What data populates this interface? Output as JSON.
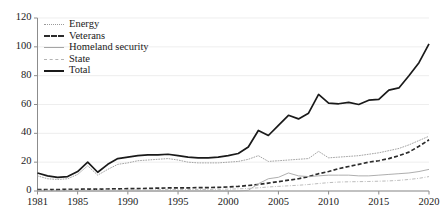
{
  "chart_data": {
    "type": "line",
    "title": "",
    "subtitle": "",
    "xlabel": "",
    "ylabel": "",
    "xlim": [
      1981,
      2020
    ],
    "ylim": [
      0,
      120
    ],
    "yticks": [
      0,
      20,
      40,
      60,
      80,
      100,
      120
    ],
    "xticks": [
      1981,
      1985,
      1990,
      1995,
      2000,
      2005,
      2010,
      2015,
      2020
    ],
    "grid": true,
    "legend_position": "upper-left",
    "x": [
      1981,
      1982,
      1983,
      1984,
      1985,
      1986,
      1987,
      1988,
      1989,
      1990,
      1991,
      1992,
      1993,
      1994,
      1995,
      1996,
      1997,
      1998,
      1999,
      2000,
      2001,
      2002,
      2003,
      2004,
      2005,
      2006,
      2007,
      2008,
      2009,
      2010,
      2011,
      2012,
      2013,
      2014,
      2015,
      2016,
      2017,
      2018,
      2019,
      2020
    ],
    "series": [
      {
        "name": "Energy",
        "style": "dotted",
        "color": "#9a9a9a",
        "values": [
          10.5,
          8.5,
          8.0,
          8.5,
          11.5,
          17.5,
          11.0,
          15.0,
          18.5,
          19.5,
          21.0,
          21.5,
          22.0,
          22.5,
          21.5,
          20.0,
          19.5,
          19.5,
          19.5,
          20.0,
          20.5,
          22.0,
          24.5,
          20.5,
          21.0,
          21.5,
          22.0,
          22.5,
          27.5,
          23.0,
          23.5,
          24.0,
          24.5,
          25.5,
          26.5,
          28.0,
          29.5,
          32.0,
          35.0,
          38.0
        ]
      },
      {
        "name": "Veterans",
        "style": "dashed",
        "color": "#2b2b2b",
        "values": [
          1.0,
          1.0,
          1.0,
          1.2,
          1.2,
          1.3,
          1.3,
          1.4,
          1.5,
          1.6,
          1.7,
          1.8,
          2.0,
          2.1,
          2.2,
          2.2,
          2.3,
          2.4,
          2.5,
          2.8,
          3.2,
          3.8,
          4.5,
          5.5,
          6.5,
          7.5,
          8.5,
          10.0,
          12.0,
          13.5,
          15.5,
          17.0,
          18.5,
          20.0,
          21.0,
          22.5,
          24.5,
          27.0,
          31.0,
          35.5
        ]
      },
      {
        "name": "Homeland security",
        "style": "solid-thin",
        "color": "#a5a5a5",
        "values": [
          0,
          0,
          0,
          0,
          0,
          0,
          0,
          0,
          0,
          0,
          0,
          0,
          0,
          0,
          0,
          0,
          0,
          0,
          0,
          0,
          0,
          0.5,
          5.0,
          8.5,
          9.5,
          12.5,
          10.5,
          10.0,
          10.5,
          11.0,
          11.0,
          11.0,
          10.5,
          10.5,
          11.0,
          11.5,
          12.0,
          12.5,
          13.5,
          15.0
        ]
      },
      {
        "name": "State",
        "style": "dash-dot",
        "color": "#b4b4b4",
        "values": [
          0.5,
          0.5,
          0.5,
          0.5,
          0.5,
          0.6,
          0.6,
          0.6,
          0.7,
          0.7,
          0.8,
          0.8,
          0.9,
          0.9,
          1.0,
          1.0,
          1.1,
          1.1,
          1.2,
          1.3,
          1.5,
          1.8,
          2.2,
          2.8,
          3.2,
          3.6,
          4.0,
          4.5,
          5.2,
          5.8,
          6.2,
          6.4,
          6.5,
          6.6,
          6.8,
          7.0,
          7.4,
          8.0,
          8.8,
          10.0
        ]
      },
      {
        "name": "Total",
        "style": "solid-thick",
        "color": "#1a1a1a",
        "values": [
          12.5,
          10.5,
          9.5,
          10.0,
          13.5,
          20.0,
          13.0,
          18.5,
          22.5,
          23.5,
          24.5,
          25.0,
          25.0,
          25.5,
          24.5,
          23.5,
          23.0,
          23.0,
          23.5,
          24.5,
          26.0,
          30.5,
          42.0,
          38.5,
          45.5,
          52.5,
          50.0,
          54.0,
          67.0,
          61.0,
          60.5,
          61.5,
          60.0,
          63.0,
          63.5,
          70.0,
          71.5,
          80.0,
          89.0,
          102.0
        ]
      }
    ]
  },
  "legend": {
    "items": [
      {
        "label": "Energy"
      },
      {
        "label": "Veterans"
      },
      {
        "label": "Homeland security"
      },
      {
        "label": "State"
      },
      {
        "label": "Total"
      }
    ]
  },
  "axes": {
    "y_tick_labels": [
      "0",
      "20",
      "40",
      "60",
      "80",
      "100",
      "120"
    ],
    "x_tick_labels": [
      "1981",
      "1985",
      "1990",
      "1995",
      "2000",
      "2005",
      "2010",
      "2015",
      "2020"
    ]
  }
}
